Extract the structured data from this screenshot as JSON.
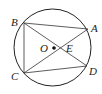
{
  "diagram": {
    "type": "geometry",
    "circle": {
      "center_label": "O",
      "cx": 52.5,
      "cy": 47.5,
      "r": 38.5
    },
    "points": [
      {
        "name": "A",
        "x": 88,
        "y": 29,
        "label_x": 91,
        "label_y": 32
      },
      {
        "name": "B",
        "x": 24,
        "y": 23,
        "label_x": 11,
        "label_y": 26
      },
      {
        "name": "C",
        "x": 24,
        "y": 73,
        "label_x": 11,
        "label_y": 80
      },
      {
        "name": "D",
        "x": 87,
        "y": 66,
        "label_x": 89,
        "label_y": 75
      },
      {
        "name": "O",
        "x": 54,
        "y": 48,
        "label_x": 40,
        "label_y": 52
      },
      {
        "name": "E",
        "x": 58,
        "y": 48,
        "label_x": 67,
        "label_y": 52
      }
    ],
    "segments": [
      "AB",
      "BC",
      "CD",
      "AC",
      "BD"
    ],
    "colors": {
      "stroke": "#222222",
      "background": "#ffffff"
    }
  },
  "labels": {
    "A": "A",
    "B": "B",
    "C": "C",
    "D": "D",
    "O": "O",
    "E": "E"
  }
}
